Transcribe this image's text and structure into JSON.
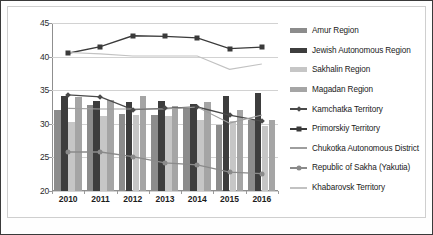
{
  "chart_data": {
    "type": "bar",
    "title": "",
    "xlabel": "",
    "ylabel": "",
    "ylim": [
      20,
      45
    ],
    "yticks": [
      20,
      25,
      30,
      35,
      40,
      45
    ],
    "grid": true,
    "legend_position": "right",
    "categories": [
      "2010",
      "2011",
      "2012",
      "2013",
      "2014",
      "2015",
      "2016"
    ],
    "series": [
      {
        "name": "Amur Region",
        "kind": "bar",
        "color": "#8c8c8c",
        "values": [
          32.1,
          32.8,
          31.5,
          31.3,
          32.5,
          29.8,
          30.6
        ]
      },
      {
        "name": "Jewish Autonomous Region",
        "kind": "bar",
        "color": "#3d3d3d",
        "values": [
          34.1,
          33.4,
          33.2,
          33.4,
          32.9,
          34.1,
          34.6
        ]
      },
      {
        "name": "Sakhalin Region",
        "kind": "bar",
        "color": "#c6c6c6",
        "values": [
          30.2,
          31.2,
          31.3,
          31.1,
          30.5,
          30.4,
          29.7
        ]
      },
      {
        "name": "Magadan Region",
        "kind": "bar",
        "color": "#a5a5a5",
        "values": [
          34.0,
          33.5,
          34.2,
          32.7,
          33.3,
          32.0,
          30.5
        ]
      },
      {
        "name": "Kamchatka Territory",
        "kind": "line",
        "color": "#4a4a4a",
        "marker": "diamond",
        "values": [
          34.3,
          34.0,
          32.1,
          32.3,
          32.5,
          31.3,
          30.4
        ]
      },
      {
        "name": "Primorskiy Territory",
        "kind": "line",
        "color": "#3a3a3a",
        "marker": "square",
        "values": [
          40.5,
          41.5,
          43.1,
          43.0,
          42.8,
          41.2,
          41.4
        ]
      },
      {
        "name": "Chukotka Autonomous District",
        "kind": "line",
        "color": "#9e9e9e",
        "marker": "none",
        "values": [
          32.3,
          32.2,
          32.2,
          32.2,
          32.5,
          30.1,
          31.3
        ]
      },
      {
        "name": "Republic of Sakha (Yakutia)",
        "kind": "line",
        "color": "#8a8a8a",
        "marker": "circle",
        "values": [
          25.8,
          25.8,
          25.1,
          24.2,
          23.9,
          22.8,
          22.6
        ]
      },
      {
        "name": "Khabarovsk Territory",
        "kind": "line",
        "color": "#c2c2c2",
        "marker": "none",
        "values": [
          40.6,
          40.4,
          40.1,
          40.1,
          40.1,
          38.1,
          38.9
        ]
      }
    ]
  },
  "legend": {
    "items": [
      {
        "label": "Amur Region"
      },
      {
        "label": "Jewish Autonomous Region"
      },
      {
        "label": "Sakhalin Region"
      },
      {
        "label": "Magadan Region"
      },
      {
        "label": "Kamchatka Territory"
      },
      {
        "label": "Primorskiy Territory"
      },
      {
        "label": "Chukotka Autonomous District"
      },
      {
        "label": "Republic of Sakha (Yakutia)"
      },
      {
        "label": "Khabarovsk Territory"
      }
    ]
  },
  "footer": {
    "smudge_text": ""
  }
}
